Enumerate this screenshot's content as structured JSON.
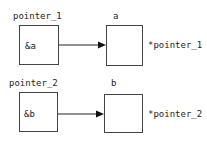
{
  "diagram": {
    "rows": [
      {
        "pointer_label": "pointer_1",
        "pointer_value": "&a",
        "target_label": "a",
        "deref_label": "*pointer_1"
      },
      {
        "pointer_label": "pointer_2",
        "pointer_value": "&b",
        "target_label": "b",
        "deref_label": "*pointer_2"
      }
    ]
  }
}
